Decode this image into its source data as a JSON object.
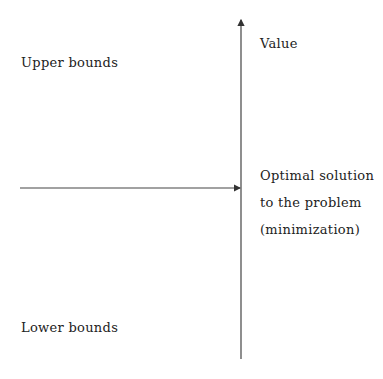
{
  "diagram": {
    "axis_label": "Value",
    "upper_label": "Upper bounds",
    "lower_label": "Lower bounds",
    "optimal_label_lines": [
      "Optimal solution",
      "to the problem",
      "(minimization)"
    ],
    "line_color": "#333333"
  }
}
